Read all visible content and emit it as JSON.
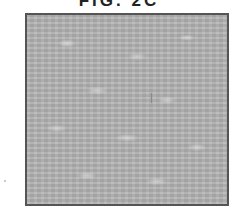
{
  "figure": {
    "label": "FIG. 2C",
    "label_cropped": true,
    "panel": {
      "description": "textured gray surface image",
      "border_color": "#555555",
      "fill_color": "#b4b4b4"
    }
  }
}
